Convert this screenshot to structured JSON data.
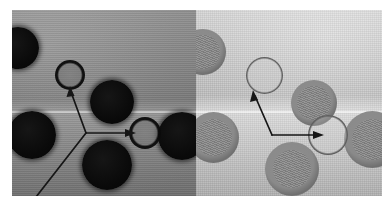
{
  "figure": {
    "type": "micrograph-pair",
    "panel_count": 2,
    "background_color": "#ffffff",
    "panels": [
      {
        "id": "left",
        "name": "left-micrograph-panel",
        "modality": "dark-field",
        "background_color": "#8d8d8d",
        "x": 12,
        "y": 10,
        "width": 184,
        "height": 186,
        "seam_y": 101,
        "annotation": {
          "type": "three-branch-arrow",
          "junction": [
            74,
            123
          ],
          "branches": [
            {
              "name": "upper-branch",
              "to": [
                58,
                80
              ],
              "arrowhead": true
            },
            {
              "name": "right-branch",
              "to": [
                121,
                123
              ],
              "arrowhead": true
            },
            {
              "name": "lower-branch",
              "to": [
                25,
                186
              ],
              "arrowhead": false
            }
          ],
          "color": "#1a1a1a",
          "stroke_width": 1.6
        },
        "objects": [
          {
            "name": "dark-cell-top-left",
            "kind": "solid-dark",
            "cx": 6,
            "cy": 38,
            "r": 21
          },
          {
            "name": "target-ring-upper",
            "kind": "dark-ring",
            "cx": 58,
            "cy": 65,
            "r": 15
          },
          {
            "name": "dark-cell-upper-right",
            "kind": "solid-dark",
            "cx": 100,
            "cy": 92,
            "r": 22
          },
          {
            "name": "dark-cell-mid-left",
            "kind": "solid-dark",
            "cx": 20,
            "cy": 125,
            "r": 24
          },
          {
            "name": "target-ring-right",
            "kind": "dark-ring",
            "cx": 133,
            "cy": 123,
            "r": 16
          },
          {
            "name": "dark-cell-far-right",
            "kind": "solid-dark",
            "cx": 170,
            "cy": 126,
            "r": 24
          },
          {
            "name": "dark-cell-bottom",
            "kind": "solid-dark",
            "cx": 95,
            "cy": 155,
            "r": 25
          }
        ]
      },
      {
        "id": "right",
        "name": "right-micrograph-panel",
        "modality": "phase-contrast",
        "background_color": "#cfcfcf",
        "x": 196,
        "y": 10,
        "width": 186,
        "height": 186,
        "seam_y": 101,
        "annotation": {
          "type": "two-branch-arrow",
          "junction": [
            76,
            125
          ],
          "branches": [
            {
              "name": "upper-branch",
              "to": [
                57,
                83
              ],
              "arrowhead": true
            },
            {
              "name": "right-branch",
              "to": [
                126,
                125
              ],
              "arrowhead": true
            }
          ],
          "color": "#1a1a1a",
          "stroke_width": 1.6
        },
        "objects": [
          {
            "name": "phase-cell-top-left",
            "kind": "phase-filled",
            "cx": 8,
            "cy": 42,
            "r": 22
          },
          {
            "name": "target-ring-upper",
            "kind": "phase-ring",
            "cx": 68,
            "cy": 66,
            "r": 18
          },
          {
            "name": "phase-cell-upper-right",
            "kind": "phase-filled",
            "cx": 118,
            "cy": 93,
            "r": 22
          },
          {
            "name": "phase-cell-mid-left",
            "kind": "phase-filled",
            "cx": 18,
            "cy": 128,
            "r": 24
          },
          {
            "name": "target-ring-right",
            "kind": "phase-ring",
            "cx": 132,
            "cy": 125,
            "r": 19
          },
          {
            "name": "phase-cell-far-right",
            "kind": "phase-filled",
            "cx": 176,
            "cy": 130,
            "r": 27
          },
          {
            "name": "phase-cell-bottom",
            "kind": "phase-filled",
            "cx": 96,
            "cy": 160,
            "r": 26
          }
        ]
      }
    ]
  }
}
